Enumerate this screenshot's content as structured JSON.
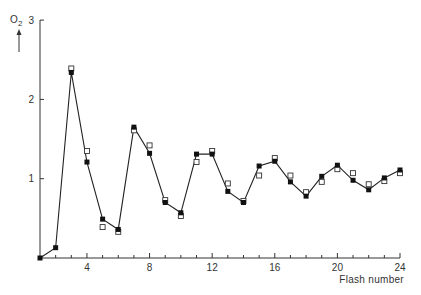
{
  "chart_data": {
    "type": "line",
    "title": "",
    "xlabel": "Flash number",
    "ylabel": "O2",
    "ylabel_main": "O",
    "ylabel_sub": "2",
    "xlim": [
      1,
      24
    ],
    "ylim": [
      0,
      3
    ],
    "x_ticks_major": [
      4,
      8,
      12,
      16,
      20,
      24
    ],
    "x_tick_labels": [
      "4",
      "8",
      "12",
      "16",
      "20",
      "24"
    ],
    "y_ticks": [
      1,
      2,
      3
    ],
    "y_tick_labels": [
      "1",
      "2",
      "3"
    ],
    "grid": false,
    "legend": null,
    "x": [
      1,
      2,
      3,
      4,
      5,
      6,
      7,
      8,
      9,
      10,
      11,
      12,
      13,
      14,
      15,
      16,
      17,
      18,
      19,
      20,
      21,
      22,
      23,
      24
    ],
    "series": [
      {
        "name": "measured (filled squares, connected)",
        "marker": "filled-square",
        "line": true,
        "values": [
          0.0,
          0.13,
          2.34,
          1.21,
          0.49,
          0.36,
          1.65,
          1.32,
          0.7,
          0.57,
          1.31,
          1.31,
          0.84,
          0.7,
          1.16,
          1.22,
          0.96,
          0.78,
          1.03,
          1.17,
          0.98,
          0.86,
          1.01,
          1.11
        ]
      },
      {
        "name": "calculated (open squares)",
        "marker": "open-square",
        "line": false,
        "values": [
          null,
          null,
          2.39,
          1.35,
          0.39,
          0.33,
          1.61,
          1.42,
          0.73,
          0.53,
          1.21,
          1.35,
          0.94,
          0.72,
          1.04,
          1.26,
          1.04,
          0.83,
          0.96,
          1.12,
          1.07,
          0.93,
          0.97,
          1.07
        ]
      }
    ]
  }
}
